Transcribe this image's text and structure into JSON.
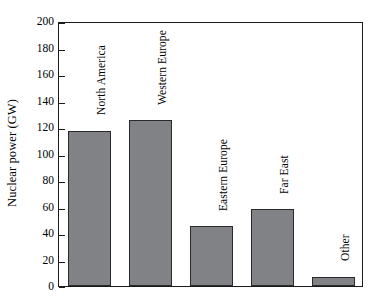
{
  "chart_data": {
    "type": "bar",
    "title": "",
    "subtitle": "",
    "xlabel": "",
    "ylabel": "Nuclear power (GW)",
    "categories": [
      "North America",
      "Western Europe",
      "Eastern Europe",
      "Far East",
      "Other"
    ],
    "values": [
      117,
      125,
      45,
      58,
      7
    ],
    "ylim": [
      0,
      200
    ],
    "ytick_labels": [
      "0",
      "20",
      "40",
      "60",
      "80",
      "100",
      "120",
      "140",
      "160",
      "180",
      "200"
    ],
    "ytick_values": [
      0,
      20,
      40,
      60,
      80,
      100,
      120,
      140,
      160,
      180,
      200
    ],
    "xtick_labels": [],
    "grid": false,
    "legend": false,
    "legend_position": "none",
    "bar_color": "#808285",
    "bar_edge_color": "#2a2a2a",
    "axis_color": "#1c1c1c",
    "background_color": "#ffffff",
    "bar_label_rotation": 90,
    "annotations": []
  }
}
